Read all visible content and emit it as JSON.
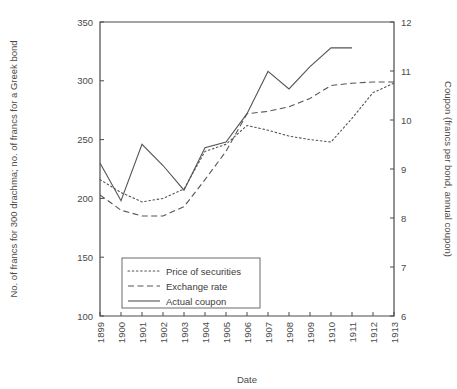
{
  "chart_data": {
    "type": "line",
    "title": "",
    "xlabel": "Date",
    "ylabel": "No. of francs for 300 drachma; no. of francs for a Greek bond",
    "y2label": "Coupon (francs per bond, annual coupon)",
    "categories": [
      "1899",
      "1900",
      "1901",
      "1902",
      "1903",
      "1904",
      "1905",
      "1906",
      "1907",
      "1908",
      "1909",
      "1910",
      "1911",
      "1912",
      "1913"
    ],
    "ylim": [
      100,
      350
    ],
    "yticks": [
      100,
      150,
      200,
      250,
      300,
      350
    ],
    "y2lim": [
      6,
      12
    ],
    "y2ticks": [
      6,
      7,
      8,
      9,
      10,
      11,
      12
    ],
    "grid": false,
    "legend_position": "bottom-left",
    "series": [
      {
        "name": "Price of securities",
        "style": "dotted",
        "axis": "left",
        "values": [
          216,
          205,
          197,
          200,
          208,
          240,
          246,
          262,
          258,
          253,
          250,
          248,
          268,
          290,
          298
        ]
      },
      {
        "name": "Exchange rate",
        "style": "dashed",
        "axis": "left",
        "values": [
          203,
          190,
          185,
          185,
          193,
          216,
          240,
          272,
          274,
          278,
          285,
          296,
          298,
          299,
          299
        ]
      },
      {
        "name": "Actual coupon",
        "style": "solid",
        "axis": "right",
        "values": [
          230,
          198,
          246,
          228,
          207,
          243,
          248,
          272,
          308,
          293,
          312,
          328,
          328,
          null,
          null
        ]
      }
    ]
  },
  "legend": {
    "items": [
      {
        "label": "Price of securities",
        "style": "dotted"
      },
      {
        "label": "Exchange rate",
        "style": "dashed"
      },
      {
        "label": "Actual coupon",
        "style": "solid"
      }
    ]
  },
  "colors": {
    "axis": "#4a4a4a",
    "series": "#555555",
    "background": "#ffffff"
  }
}
